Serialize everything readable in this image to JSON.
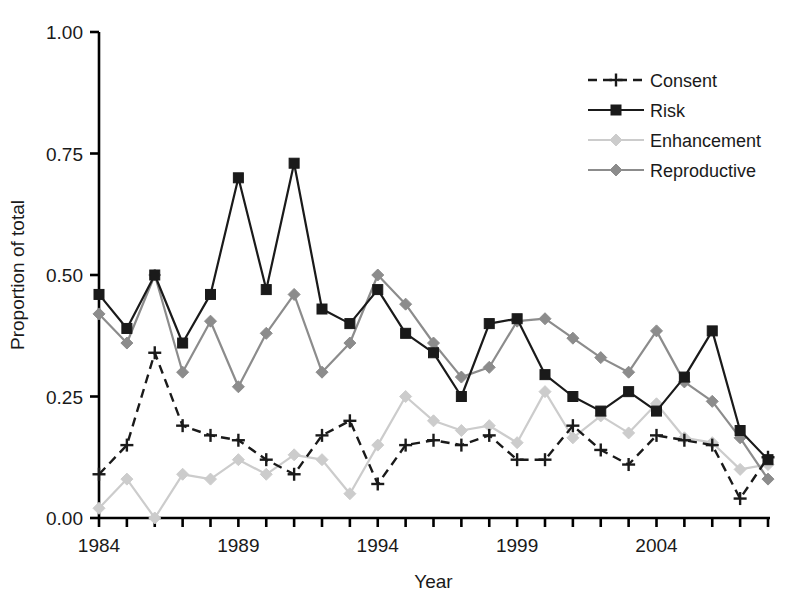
{
  "chart_data": {
    "type": "line",
    "title": "",
    "xlabel": "Year",
    "ylabel": "Proportion of total",
    "xlim": [
      1984,
      2008
    ],
    "ylim": [
      0.0,
      1.0
    ],
    "yticks": [
      0.0,
      0.25,
      0.5,
      0.75,
      1.0
    ],
    "ytick_labels": [
      "0.00",
      "0.25",
      "0.50",
      "0.75",
      "1.00"
    ],
    "xticks": [
      1984,
      1985,
      1986,
      1987,
      1988,
      1989,
      1990,
      1991,
      1992,
      1993,
      1994,
      1995,
      1996,
      1997,
      1998,
      1999,
      2000,
      2001,
      2002,
      2003,
      2004,
      2005,
      2006,
      2007,
      2008
    ],
    "xtick_labels_shown": [
      "1984",
      "1989",
      "1994",
      "1999",
      "2004"
    ],
    "xtick_labels_shown_at": [
      1984,
      1989,
      1994,
      1999,
      2004
    ],
    "grid": false,
    "legend_position": "top-right",
    "x": [
      1984,
      1985,
      1986,
      1987,
      1988,
      1989,
      1990,
      1991,
      1992,
      1993,
      1994,
      1995,
      1996,
      1997,
      1998,
      1999,
      2000,
      2001,
      2002,
      2003,
      2004,
      2005,
      2006,
      2007,
      2008
    ],
    "series": [
      {
        "name": "Consent",
        "color": "#1a1a1a",
        "marker": "plus",
        "dash": "dashed",
        "values": [
          0.09,
          0.15,
          0.34,
          0.19,
          0.17,
          0.16,
          0.12,
          0.09,
          0.17,
          0.2,
          0.07,
          0.15,
          0.16,
          0.15,
          0.17,
          0.12,
          0.12,
          0.19,
          0.14,
          0.11,
          0.17,
          0.16,
          0.15,
          0.04,
          0.125
        ]
      },
      {
        "name": "Risk",
        "color": "#1a1a1a",
        "marker": "square",
        "dash": "solid",
        "values": [
          0.46,
          0.39,
          0.5,
          0.36,
          0.46,
          0.7,
          0.47,
          0.73,
          0.43,
          0.4,
          0.47,
          0.38,
          0.34,
          0.25,
          0.4,
          0.41,
          0.295,
          0.25,
          0.22,
          0.26,
          0.22,
          0.29,
          0.385,
          0.18,
          0.12
        ]
      },
      {
        "name": "Enhancement",
        "color": "#cccccc",
        "marker": "diamond",
        "dash": "solid",
        "values": [
          0.02,
          0.08,
          0.0,
          0.09,
          0.08,
          0.12,
          0.09,
          0.13,
          0.12,
          0.05,
          0.15,
          0.25,
          0.2,
          0.18,
          0.19,
          0.155,
          0.26,
          0.165,
          0.21,
          0.175,
          0.235,
          0.165,
          0.155,
          0.1,
          0.11
        ]
      },
      {
        "name": "Reproductive",
        "color": "#8c8c8c",
        "marker": "diamond",
        "dash": "solid",
        "values": [
          0.42,
          0.36,
          0.5,
          0.3,
          0.405,
          0.27,
          0.38,
          0.46,
          0.3,
          0.36,
          0.5,
          0.44,
          0.36,
          0.29,
          0.31,
          0.405,
          0.41,
          0.37,
          0.33,
          0.3,
          0.385,
          0.28,
          0.24,
          0.165,
          0.08
        ]
      }
    ]
  },
  "axis": {
    "y_title": "Proportion of total",
    "x_title": "Year"
  },
  "legend": {
    "items": [
      {
        "label": "Consent"
      },
      {
        "label": "Risk"
      },
      {
        "label": "Enhancement"
      },
      {
        "label": "Reproductive"
      }
    ]
  }
}
